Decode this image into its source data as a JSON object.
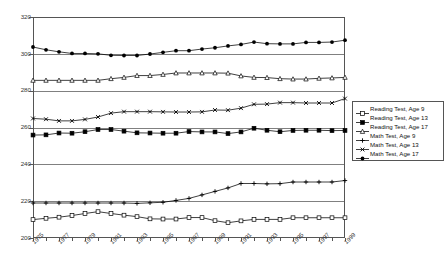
{
  "chart_data": {
    "type": "line",
    "title": "",
    "xlabel": "",
    "ylabel": "",
    "ylim": [
      200,
      320
    ],
    "ytick_values": [
      200,
      220,
      240,
      260,
      280,
      300,
      320
    ],
    "grid": true,
    "legend_position": "right",
    "x": [
      1975,
      1976,
      1977,
      1978,
      1979,
      1980,
      1981,
      1982,
      1983,
      1984,
      1985,
      1986,
      1987,
      1988,
      1989,
      1990,
      1991,
      1992,
      1993,
      1994,
      1995,
      1996,
      1997,
      1998,
      1999
    ],
    "xtick_labels": [
      "1975",
      "1977",
      "1979",
      "1981",
      "1983",
      "1985",
      "1987",
      "1989",
      "1991",
      "1993",
      "1995",
      "1997",
      "1999"
    ],
    "series": [
      {
        "name": "Reading Test, Age 9",
        "marker": "open-square",
        "values": [
          210.0,
          210.7,
          211.3,
          212.2,
          213.3,
          214.3,
          213.3,
          212.4,
          211.6,
          210.4,
          210.3,
          210.3,
          211.1,
          211.1,
          209.4,
          208.3,
          209.3,
          210.1,
          210.1,
          210.1,
          211.0,
          211.0,
          211.0,
          211.0,
          211.0
        ]
      },
      {
        "name": "Reading Test, Age 13",
        "marker": "filled-square",
        "values": [
          255.9,
          256.0,
          257.0,
          256.9,
          257.7,
          258.9,
          258.9,
          258.0,
          257.1,
          257.0,
          256.9,
          256.9,
          257.8,
          257.6,
          257.6,
          256.7,
          257.6,
          259.6,
          258.5,
          257.7,
          258.4,
          258.5,
          258.5,
          258.3,
          258.4
        ]
      },
      {
        "name": "Reading Test, Age 17",
        "marker": "open-triangle",
        "values": [
          285.6,
          285.6,
          285.6,
          285.6,
          285.6,
          285.6,
          286.5,
          287.2,
          288.2,
          288.2,
          288.8,
          289.6,
          289.6,
          289.6,
          289.6,
          289.5,
          288.0,
          287.2,
          287.1,
          286.5,
          286.3,
          286.3,
          286.7,
          286.9,
          287.2
        ]
      },
      {
        "name": "Math Test, Age 9",
        "marker": "plus",
        "values": [
          219.0,
          219.0,
          219.0,
          219.0,
          219.0,
          219.0,
          219.0,
          219.0,
          218.8,
          219.1,
          219.4,
          220.4,
          221.5,
          223.4,
          225.3,
          227.2,
          229.6,
          229.6,
          229.4,
          229.5,
          230.4,
          230.4,
          230.4,
          230.4,
          231.2
        ]
      },
      {
        "name": "Math Test, Age 13",
        "marker": "cross",
        "values": [
          264.9,
          264.5,
          263.6,
          263.6,
          264.4,
          265.7,
          267.8,
          268.6,
          268.6,
          268.6,
          268.5,
          268.4,
          268.4,
          268.5,
          269.5,
          269.4,
          270.5,
          272.6,
          272.7,
          273.5,
          273.5,
          273.3,
          273.3,
          273.3,
          275.7
        ]
      },
      {
        "name": "Math Test, Age 17",
        "marker": "filled-circle",
        "values": [
          303.7,
          302.2,
          301.1,
          300.2,
          300.2,
          300.0,
          299.2,
          299.1,
          299.1,
          299.9,
          300.8,
          301.7,
          301.7,
          302.6,
          303.3,
          304.3,
          305.1,
          306.4,
          305.5,
          305.4,
          305.4,
          306.2,
          306.2,
          306.4,
          307.4
        ]
      }
    ]
  },
  "legend": {
    "items": [
      {
        "label": "Reading Test, Age 9"
      },
      {
        "label": "Reading Test, Age 13"
      },
      {
        "label": "Reading Test, Age 17"
      },
      {
        "label": "Math Test, Age 9"
      },
      {
        "label": "Math Test, Age 13"
      },
      {
        "label": "Math Test, Age 17"
      }
    ]
  },
  "axis": {
    "y_labels": [
      "320",
      "300",
      "280",
      "260",
      "240",
      "220",
      "200"
    ],
    "x_labels": [
      "1975",
      "1977",
      "1979",
      "1981",
      "1983",
      "1985",
      "1987",
      "1989",
      "1991",
      "1993",
      "1995",
      "1997",
      "1999"
    ]
  }
}
